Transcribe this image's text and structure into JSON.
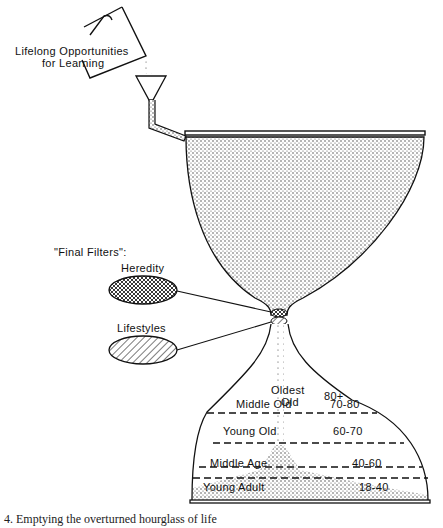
{
  "figure": {
    "source_label": {
      "line1": "Lifelong Opportunities",
      "line2": "for Learning"
    },
    "filters_title": "\"Final Filters\":",
    "filters": [
      {
        "label": "Heredity",
        "pattern": "crosshatch"
      },
      {
        "label": "Lifestyles",
        "pattern": "diagonal-lines"
      }
    ],
    "stages": [
      {
        "name_line1": "Oldest",
        "name_line2": "Old",
        "ages": "80+"
      },
      {
        "name": "Middle Old",
        "ages": "70-80"
      },
      {
        "name": "Young Old",
        "ages": "60-70"
      },
      {
        "name": "Middle Age",
        "ages": "40-60"
      },
      {
        "name": "Young Adult",
        "ages": "18-40"
      }
    ],
    "caption": "4.   Emptying the overturned hourglass of life"
  }
}
